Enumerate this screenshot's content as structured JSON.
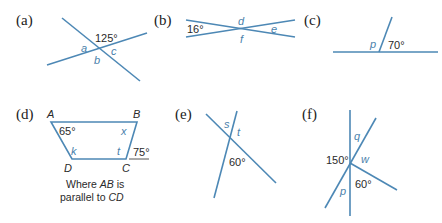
{
  "colors": {
    "line": "#4d88b5",
    "variable_label": "#4a7fab",
    "text": "#222222"
  },
  "figures": [
    {
      "id": "a",
      "label": "(a)",
      "given": [
        "125°"
      ],
      "unknowns": [
        "a",
        "b",
        "c"
      ]
    },
    {
      "id": "b",
      "label": "(b)",
      "given": [
        "16°"
      ],
      "unknowns": [
        "d",
        "e",
        "f"
      ]
    },
    {
      "id": "c",
      "label": "(c)",
      "given": [
        "70°"
      ],
      "unknowns": [
        "p"
      ]
    },
    {
      "id": "d",
      "label": "(d)",
      "vertices": [
        "A",
        "B",
        "C",
        "D"
      ],
      "given": [
        "65°",
        "75°"
      ],
      "unknowns": [
        "x",
        "k",
        "t"
      ],
      "note_line1": "Where AB is",
      "note_line2": "parallel to CD",
      "note_parts": {
        "l1a": "Where ",
        "l1b": "AB",
        "l1c": " is",
        "l2a": "parallel to ",
        "l2b": "CD"
      }
    },
    {
      "id": "e",
      "label": "(e)",
      "given": [
        "60°"
      ],
      "unknowns": [
        "s",
        "t"
      ]
    },
    {
      "id": "f",
      "label": "(f)",
      "given": [
        "150°",
        "60°"
      ],
      "unknowns": [
        "q",
        "w",
        "p"
      ]
    }
  ]
}
